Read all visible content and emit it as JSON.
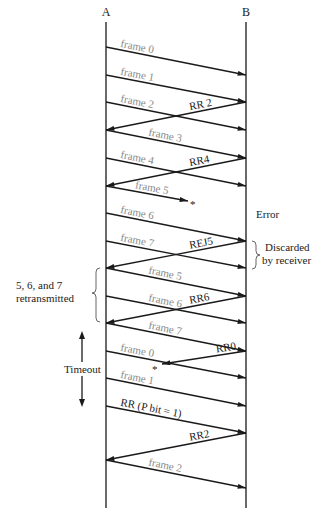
{
  "stations": {
    "a": "A",
    "b": "B"
  },
  "geometry": {
    "ax": 106,
    "bx": 246,
    "top": 18,
    "bottom": 508
  },
  "messages": [
    {
      "id": "frame0",
      "label": "frame 0",
      "dir": "AB",
      "y1": 47,
      "y2": 75,
      "kind": "frame"
    },
    {
      "id": "frame1",
      "label": "frame 1",
      "dir": "AB",
      "y1": 75,
      "y2": 102,
      "kind": "frame"
    },
    {
      "id": "frame2",
      "label": "frame 2",
      "dir": "AB",
      "y1": 102,
      "y2": 130,
      "kind": "frame"
    },
    {
      "id": "rr2",
      "label": "RR 2",
      "dir": "BA",
      "y1": 102,
      "y2": 130,
      "kind": "ack"
    },
    {
      "id": "frame3",
      "label": "frame 3",
      "dir": "AB",
      "y1": 130,
      "y2": 158,
      "kind": "frame"
    },
    {
      "id": "frame4",
      "label": "frame 4",
      "dir": "AB",
      "y1": 158,
      "y2": 186,
      "kind": "frame"
    },
    {
      "id": "rr4",
      "label": "RR4",
      "dir": "BA",
      "y1": 158,
      "y2": 186,
      "kind": "ack"
    },
    {
      "id": "frame5",
      "label": "frame 5",
      "dir": "AB",
      "y1": 186,
      "y2": 201,
      "kind": "frame",
      "lost": true,
      "endx": 188
    },
    {
      "id": "frame6",
      "label": "frame 6",
      "dir": "AB",
      "y1": 213,
      "y2": 241,
      "kind": "frame"
    },
    {
      "id": "frame7",
      "label": "frame 7",
      "dir": "AB",
      "y1": 241,
      "y2": 268,
      "kind": "frame"
    },
    {
      "id": "rej5",
      "label": "REJ5",
      "dir": "BA",
      "y1": 241,
      "y2": 268,
      "kind": "ack"
    },
    {
      "id": "frame5r",
      "label": "frame 5",
      "dir": "AB",
      "y1": 268,
      "y2": 296,
      "kind": "frame"
    },
    {
      "id": "frame6r",
      "label": "frame 6",
      "dir": "AB",
      "y1": 296,
      "y2": 323,
      "kind": "frame"
    },
    {
      "id": "rr6",
      "label": "RR6",
      "dir": "BA",
      "y1": 296,
      "y2": 323,
      "kind": "ack"
    },
    {
      "id": "frame7r",
      "label": "frame 7",
      "dir": "AB",
      "y1": 323,
      "y2": 351,
      "kind": "frame"
    },
    {
      "id": "frame0b",
      "label": "frame 0",
      "dir": "AB",
      "y1": 351,
      "y2": 378,
      "kind": "frame"
    },
    {
      "id": "rr0",
      "label": "RR0",
      "dir": "BA",
      "y1": 351,
      "y2": 364,
      "kind": "ack",
      "lost": true,
      "endx": 162
    },
    {
      "id": "frame1b",
      "label": "frame 1",
      "dir": "AB",
      "y1": 378,
      "y2": 406,
      "kind": "frame"
    },
    {
      "id": "rrpoll",
      "label": "RR (P bit = 1)",
      "dir": "AB",
      "y1": 406,
      "y2": 433,
      "kind": "ack"
    },
    {
      "id": "rr2b",
      "label": "RR2",
      "dir": "BA",
      "y1": 433,
      "y2": 460,
      "kind": "ack"
    },
    {
      "id": "frame2b",
      "label": "frame 2",
      "dir": "AB",
      "y1": 460,
      "y2": 488,
      "kind": "frame"
    }
  ],
  "lost_marker": "*",
  "annotations": {
    "error": "Error",
    "discarded_line1": "Discarded",
    "discarded_line2": "by receiver",
    "retransmitted_line1": "5, 6, and 7",
    "retransmitted_line2": "retransmitted",
    "timeout": "Timeout"
  },
  "colors": {
    "line": "#1a1a1a",
    "frame_label": "#8a8a8a",
    "ack_label": "#1a1a1a"
  }
}
